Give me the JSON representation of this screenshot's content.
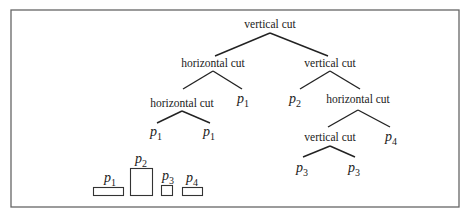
{
  "diagram": {
    "type": "slicing-tree",
    "colors": {
      "line": "#222222",
      "frame": "#666666",
      "text": "#1a1a1a",
      "background": "#ffffff"
    },
    "nodes": {
      "root": {
        "label": "vertical cut"
      },
      "left1": {
        "label": "horizontal cut"
      },
      "left1_leaf": {
        "name": "p",
        "sub": "1"
      },
      "left2": {
        "label": "horizontal cut"
      },
      "left2_leaf_a": {
        "name": "p",
        "sub": "1"
      },
      "left2_leaf_b": {
        "name": "p",
        "sub": "1"
      },
      "right1": {
        "label": "vertical cut"
      },
      "right1_leaf": {
        "name": "p",
        "sub": "2"
      },
      "right2": {
        "label": "horizontal cut"
      },
      "right2_leaf": {
        "name": "p",
        "sub": "4"
      },
      "right3": {
        "label": "vertical cut"
      },
      "right3_leaf_a": {
        "name": "p",
        "sub": "3"
      },
      "right3_leaf_b": {
        "name": "p",
        "sub": "3"
      }
    },
    "legend": [
      {
        "name": "p",
        "sub": "1"
      },
      {
        "name": "p",
        "sub": "2"
      },
      {
        "name": "p",
        "sub": "3"
      },
      {
        "name": "p",
        "sub": "4"
      }
    ]
  }
}
